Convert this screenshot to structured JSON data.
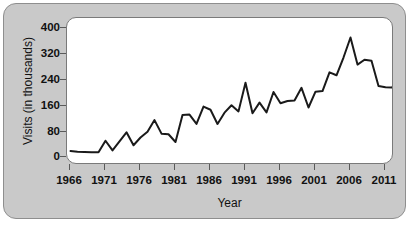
{
  "figure": {
    "background_color": "#c9c9c9",
    "plot_background_color": "#ffffff",
    "frame_color": "#8e8e8e",
    "line_color": "#1a1a1a"
  },
  "axes": {
    "x_title": "Year",
    "y_title": "Visits (in thousands)",
    "x_ticks": [
      "1966",
      "1971",
      "1976",
      "1981",
      "1986",
      "1991",
      "1996",
      "2001",
      "2006",
      "2011"
    ],
    "y_ticks": [
      "400",
      "320",
      "240",
      "160",
      "80",
      "0"
    ]
  },
  "chart_data": {
    "type": "line",
    "title": "",
    "xlabel": "Year",
    "ylabel": "Visits (in thousands)",
    "xlim": [
      1966,
      2013
    ],
    "ylim": [
      0,
      420
    ],
    "xtick_values": [
      1966,
      1971,
      1976,
      1981,
      1986,
      1991,
      1996,
      2001,
      2006,
      2011
    ],
    "ytick_values": [
      0,
      80,
      160,
      240,
      320,
      400
    ],
    "grid": false,
    "legend": null,
    "series": [
      {
        "name": "Visits (in thousands)",
        "x": [
          1966,
          1967,
          1968,
          1969,
          1970,
          1971,
          1972,
          1973,
          1974,
          1975,
          1976,
          1977,
          1978,
          1979,
          1980,
          1981,
          1982,
          1983,
          1984,
          1985,
          1986,
          1987,
          1988,
          1989,
          1990,
          1991,
          1992,
          1993,
          1994,
          1995,
          1996,
          1997,
          1998,
          1999,
          2000,
          2001,
          2002,
          2003,
          2004,
          2005,
          2006,
          2007,
          2008,
          2009,
          2010,
          2011,
          2012,
          2013
        ],
        "values": [
          20,
          18,
          17,
          16,
          16,
          52,
          22,
          50,
          78,
          38,
          62,
          80,
          116,
          74,
          72,
          48,
          132,
          133,
          104,
          158,
          148,
          104,
          139,
          162,
          143,
          232,
          137,
          170,
          140,
          203,
          168,
          175,
          177,
          216,
          155,
          204,
          206,
          264,
          255,
          310,
          372,
          288,
          303,
          300,
          222,
          218,
          217,
          299
        ]
      }
    ]
  }
}
